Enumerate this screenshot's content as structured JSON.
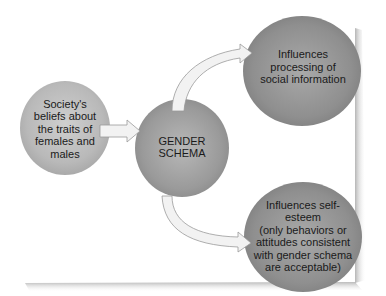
{
  "diagram": {
    "nodes": [
      {
        "id": "society",
        "label": "Society's\nbeliefs about\nthe traits of\nfemales and\nmales"
      },
      {
        "id": "gender_schema",
        "label": "GENDER\nSCHEMA"
      },
      {
        "id": "social_info",
        "label": "Influences\nprocessing of\nsocial information"
      },
      {
        "id": "self_esteem",
        "label": "Influences self-\nesteem\n(only behaviors or\nattitudes consistent\nwith gender schema\nare acceptable)"
      }
    ],
    "edges": [
      {
        "from": "society",
        "to": "gender_schema"
      },
      {
        "from": "gender_schema",
        "to": "social_info"
      },
      {
        "from": "gender_schema",
        "to": "self_esteem"
      }
    ],
    "colors": {
      "node_fill_light": "#c8c8c8",
      "node_fill_dark": "#8a8a8a",
      "arrow_fill": "#f2f2f2",
      "arrow_stroke": "#9a9a9a",
      "shadow": "#b5b5b5"
    }
  }
}
